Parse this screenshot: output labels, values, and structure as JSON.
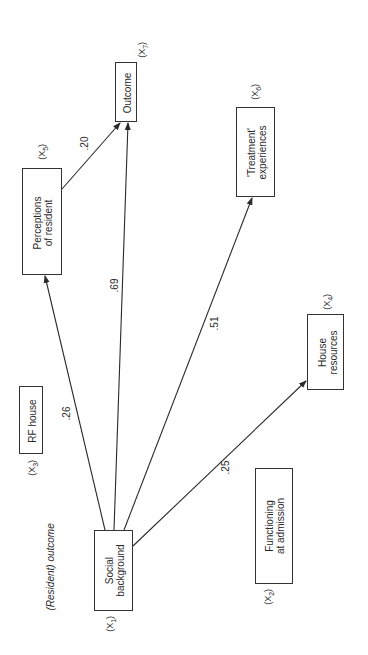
{
  "title_note": "(Resident) outcome",
  "nodes": [
    {
      "id": "x1",
      "label": "Social\nbackground",
      "var": "X",
      "sub": "1"
    },
    {
      "id": "x2",
      "label": "Functioning\nat admission",
      "var": "X",
      "sub": "2"
    },
    {
      "id": "x3",
      "label": "RF house",
      "var": "X",
      "sub": "3"
    },
    {
      "id": "x4",
      "label": "House\nresources",
      "var": "X",
      "sub": "4"
    },
    {
      "id": "x5",
      "label": "Perceptions\nof resident",
      "var": "X",
      "sub": "5"
    },
    {
      "id": "x6",
      "label": "'Treatment'\nexperiences",
      "var": "X",
      "sub": "6"
    },
    {
      "id": "x7",
      "label": "Outcome",
      "var": "X",
      "sub": "7"
    }
  ],
  "edges": [
    {
      "from": "x1",
      "to": "x5",
      "coef": ".26"
    },
    {
      "from": "x1",
      "to": "x7",
      "coef": ".69"
    },
    {
      "from": "x1",
      "to": "x6",
      "coef": ".51"
    },
    {
      "from": "x1",
      "to": "x4",
      "coef": ".25"
    },
    {
      "from": "x5",
      "to": "x7",
      "coef": ".20"
    }
  ],
  "colors": {
    "line": "#2a2a2a",
    "background": "#ffffff"
  }
}
